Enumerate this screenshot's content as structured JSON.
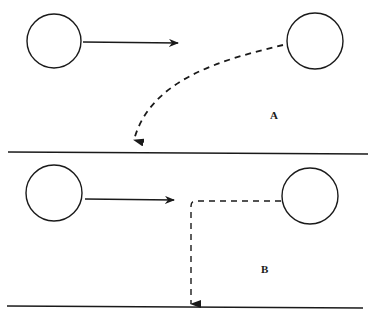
{
  "diagram": {
    "stroke_color": "#1a1a1a",
    "background": "#ffffff",
    "panels": [
      {
        "label": "A",
        "description": "Object moving horizontally vs. object falling along curved dashed trajectory to ground line",
        "moving_object_arrow": "solid",
        "falling_path": "curved-dashed"
      },
      {
        "label": "B",
        "description": "Object moving horizontally vs. object following right-angle dashed path down to ground line",
        "moving_object_arrow": "solid",
        "falling_path": "right-angle-dashed"
      }
    ]
  }
}
